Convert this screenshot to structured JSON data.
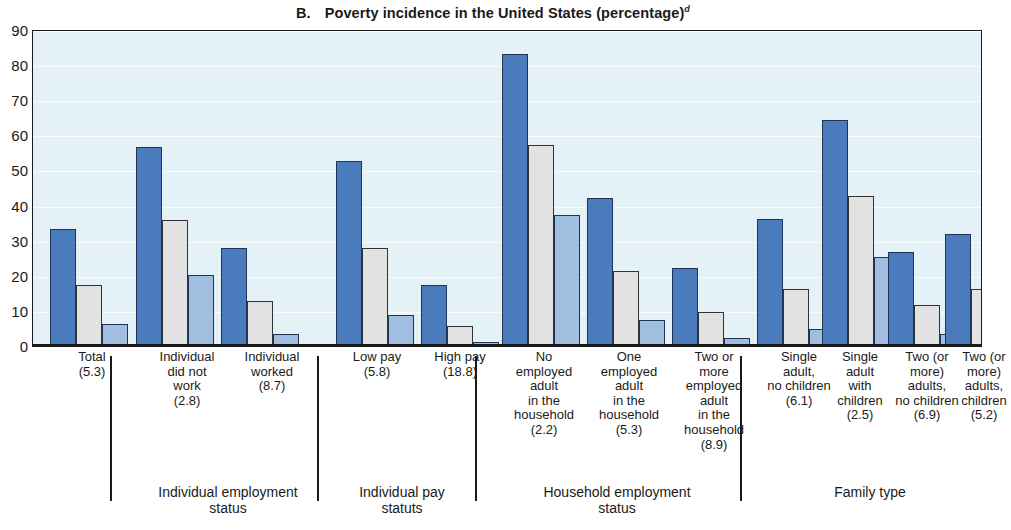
{
  "title": {
    "letter": "B.",
    "text": "Poverty incidence in the United States (percentage)",
    "superscript": "d"
  },
  "colors": {
    "series1": "#4a7cbd",
    "series2": "#e2e2e2",
    "series3": "#9fbee0",
    "plot_background": "#e4f2f7",
    "axis": "#1a1a1a"
  },
  "chart_data": {
    "type": "bar",
    "xlabel": "",
    "ylabel": "",
    "ylim": [
      0,
      90
    ],
    "yticks": [
      0,
      10,
      20,
      30,
      40,
      50,
      60,
      70,
      80,
      90
    ],
    "grid": true,
    "legend": "none",
    "categories": [
      "Total (5.3)",
      "Individual did not work (2.8)",
      "Individual worked (8.7)",
      "Low pay (5.8)",
      "High pay (18.8)",
      "No employed adult in the household (2.2)",
      "One employed adult in the household (5.3)",
      "Two or more employed adult in the household (8.9)",
      "Single adult, no children (6.1)",
      "Single adult with children (2.5)",
      "Two (or more) adults, no children (6.9)",
      "Two (or more) adults, children (5.2)"
    ],
    "series": [
      {
        "name": "series-1",
        "values": [
          33,
          56.5,
          27.5,
          52.5,
          17,
          83,
          42,
          22,
          36,
          64,
          26.5,
          31.5
        ]
      },
      {
        "name": "series-2",
        "values": [
          17,
          35.5,
          12.5,
          27.5,
          5.5,
          57,
          21,
          9.5,
          16,
          42.5,
          11.5,
          16
        ]
      },
      {
        "name": "series-3",
        "values": [
          6,
          20,
          3,
          8.5,
          1,
          37,
          7,
          2,
          4.5,
          25,
          3,
          4.5
        ]
      }
    ]
  },
  "axis": {
    "y_ticks": [
      "90",
      "80",
      "70",
      "60",
      "50",
      "40",
      "30",
      "20",
      "10",
      "0"
    ]
  },
  "x_labels": [
    {
      "lines": [
        "Total",
        "(5.3)"
      ],
      "center": 60
    },
    {
      "lines": [
        "Individual",
        "did not",
        "work",
        "(2.8)"
      ],
      "center": 155
    },
    {
      "lines": [
        "Individual",
        "worked",
        "(8.7)"
      ],
      "center": 240
    },
    {
      "lines": [
        "Low pay",
        "(5.8)"
      ],
      "center": 345
    },
    {
      "lines": [
        "High pay",
        "(18.8)"
      ],
      "center": 428
    },
    {
      "lines": [
        "No",
        "employed",
        "adult",
        "in the",
        "household",
        "(2.2)"
      ],
      "center": 512
    },
    {
      "lines": [
        "One",
        "employed",
        "adult",
        "in the",
        "household",
        "(5.3)"
      ],
      "center": 597
    },
    {
      "lines": [
        "Two or",
        "more",
        "employed",
        "adult",
        "in the",
        "household",
        "(8.9)"
      ],
      "center": 682
    },
    {
      "lines": [
        "Single",
        "adult,",
        "no children",
        "(6.1)"
      ],
      "center": 767
    },
    {
      "lines": [
        "Single",
        "adult",
        "with",
        "children",
        "(2.5)"
      ],
      "center": 828
    },
    {
      "lines": [
        "Two (or",
        "more)",
        "adults,",
        "no children",
        "(6.9)"
      ],
      "center": 895
    },
    {
      "lines": [
        "Two (or",
        "more)",
        "adults,",
        "children",
        "(5.2)"
      ],
      "center": 952
    }
  ],
  "group_sections": [
    {
      "label_lines": [
        "Individual employment",
        "status"
      ],
      "center": 196,
      "sep_left": 78,
      "sep_right": 285
    },
    {
      "label_lines": [
        "Individual pay",
        "statuts"
      ],
      "center": 370,
      "sep_left": 285,
      "sep_right": 443
    },
    {
      "label_lines": [
        "Household employment",
        "status"
      ],
      "center": 585,
      "sep_left": 443,
      "sep_right": 708
    },
    {
      "label_lines": [
        "Family type"
      ],
      "center": 838,
      "sep_left": 708,
      "sep_right": 950
    }
  ],
  "bar_groups": [
    {
      "x": 17,
      "values": [
        33,
        17,
        6
      ]
    },
    {
      "x": 103,
      "values": [
        56.5,
        35.5,
        20
      ]
    },
    {
      "x": 188,
      "values": [
        27.5,
        12.5,
        3
      ]
    },
    {
      "x": 303,
      "values": [
        52.5,
        27.5,
        8.5
      ]
    },
    {
      "x": 388,
      "values": [
        17,
        5.5,
        1
      ]
    },
    {
      "x": 469,
      "values": [
        83,
        57,
        37
      ]
    },
    {
      "x": 554,
      "values": [
        42,
        21,
        7
      ]
    },
    {
      "x": 639,
      "values": [
        22,
        9.5,
        2
      ]
    },
    {
      "x": 724,
      "values": [
        36,
        16,
        4.5
      ]
    },
    {
      "x": 789,
      "values": [
        64,
        42.5,
        25
      ]
    },
    {
      "x": 855,
      "values": [
        26.5,
        11.5,
        3
      ]
    },
    {
      "x": 912,
      "values": [
        31.5,
        16,
        4.5
      ]
    }
  ]
}
